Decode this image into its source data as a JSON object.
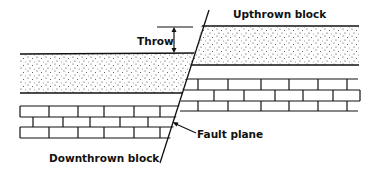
{
  "diagram": {
    "labels": {
      "throw": "Throw",
      "upthrown_block": "Upthrown block",
      "downthrown_block": "Downthrown block",
      "fault_plane": "Fault plane"
    },
    "colors": {
      "line": "#111111",
      "background": "#ffffff",
      "stipple": "#333333"
    },
    "layers": [
      {
        "name": "sandstone",
        "pattern": "stipple"
      },
      {
        "name": "limestone",
        "pattern": "brick"
      }
    ]
  }
}
